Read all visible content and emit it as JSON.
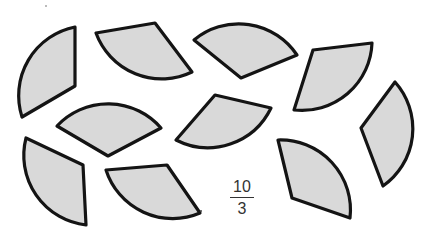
{
  "figure": {
    "fill_color": "#d9d9d9",
    "stroke_color": "#141414",
    "sector_count": 10,
    "sectors": [
      {
        "id": 1,
        "path": "M75,27 L75,86 L22,117 A70,70 0 0 1 75,27 Z"
      },
      {
        "id": 2,
        "path": "M96,33 L155,23 L192,72 A70,70 0 0 1 96,33 Z"
      },
      {
        "id": 3,
        "path": "M194,40 L241,78 L297,55 A70,70 0 0 0 194,40 Z"
      },
      {
        "id": 4,
        "path": "M294,110 L313,50 L372,43 A70,70 0 0 1 294,110 Z"
      },
      {
        "id": 5,
        "path": "M395,82 L361,128 L383,186 A70,70 0 0 0 395,82 Z"
      },
      {
        "id": 6,
        "path": "M57,126 L108,156 L161,128 A70,70 0 0 0 57,126 Z"
      },
      {
        "id": 7,
        "path": "M176,140 L215,95 L271,108 A70,70 0 0 1 176,140 Z"
      },
      {
        "id": 8,
        "path": "M26,138 L83,165 L86,225 A70,70 0 0 1 26,138 Z"
      },
      {
        "id": 9,
        "path": "M106,170 L167,165 L200,213 A70,70 0 0 1 106,170 Z"
      },
      {
        "id": 10,
        "path": "M278,140 L292,198 L350,218 A70,70 0 0 0 278,140 Z"
      }
    ]
  },
  "label": {
    "numerator": "10",
    "denominator": "3"
  }
}
